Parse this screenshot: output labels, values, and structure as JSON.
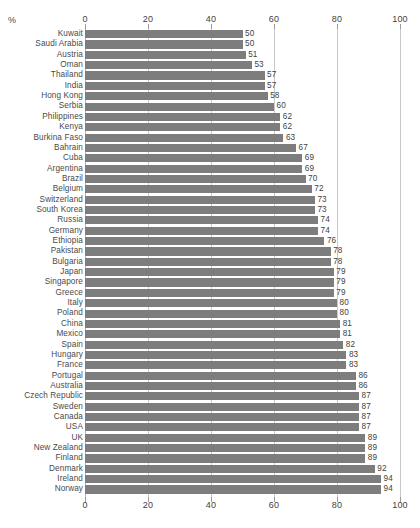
{
  "unit_label": "%",
  "axis": {
    "ticks": [
      0,
      20,
      40,
      60,
      80,
      100
    ],
    "min": 0,
    "max": 100
  },
  "colors": {
    "bar": "#7d7d7d",
    "gridline": "#c8c8c8",
    "text": "#4a4a4a",
    "background": "#ffffff"
  },
  "chart_data": {
    "type": "bar",
    "orientation": "horizontal",
    "title": "",
    "xlabel": "%",
    "ylabel": "",
    "xlim": [
      0,
      100
    ],
    "grid": true,
    "legend": false,
    "axis_position": "both",
    "categories": [
      "Kuwait",
      "Saudi Arabia",
      "Austria",
      "Oman",
      "Thailand",
      "India",
      "Hong Kong",
      "Serbia",
      "Philippines",
      "Kenya",
      "Burkina Faso",
      "Bahrain",
      "Cuba",
      "Argentina",
      "Brazil",
      "Belgium",
      "Switzerland",
      "South Korea",
      "Russia",
      "Germany",
      "Ethiopia",
      "Pakistan",
      "Bulgaria",
      "Japan",
      "Singapore",
      "Greece",
      "Italy",
      "Poland",
      "China",
      "Mexico",
      "Spain",
      "Hungary",
      "France",
      "Portugal",
      "Australia",
      "Czech Republic",
      "Sweden",
      "Canada",
      "USA",
      "UK",
      "New Zealand",
      "Finland",
      "Denmark",
      "Ireland",
      "Norway"
    ],
    "values": [
      50,
      50,
      51,
      53,
      57,
      57,
      58,
      60,
      62,
      62,
      63,
      67,
      69,
      69,
      70,
      72,
      73,
      73,
      74,
      74,
      76,
      78,
      78,
      79,
      79,
      79,
      80,
      80,
      81,
      81,
      82,
      83,
      83,
      86,
      86,
      87,
      87,
      87,
      87,
      89,
      89,
      89,
      92,
      94,
      94
    ]
  }
}
